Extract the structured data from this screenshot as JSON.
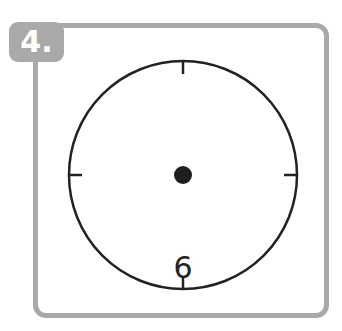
{
  "exercise": {
    "number_label": "4.",
    "frame_color": "#a9a9a9",
    "badge_text_color": "#ffffff"
  },
  "clock": {
    "center": [
      183,
      175
    ],
    "radius": 114,
    "stroke_color": "#222222",
    "tick_marks": [
      "12",
      "3",
      "6",
      "9"
    ],
    "numerals": [
      {
        "position": "6",
        "label": "6"
      }
    ],
    "center_dot": true
  }
}
